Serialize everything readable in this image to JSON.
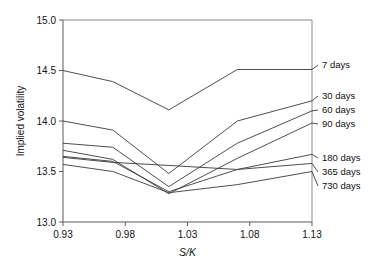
{
  "chart_data": {
    "type": "line",
    "title": "",
    "xlabel": "S/K",
    "ylabel": "Implied volatility",
    "xlim": [
      0.93,
      1.13
    ],
    "ylim": [
      13.0,
      15.0
    ],
    "xticks": [
      "0.93",
      "0.98",
      "1.03",
      "1.08",
      "1.13"
    ],
    "xtick_values": [
      0.93,
      0.98,
      1.03,
      1.08,
      1.13
    ],
    "yticks": [
      "13.0",
      "13.5",
      "14.0",
      "14.5",
      "15.0"
    ],
    "ytick_values": [
      13.0,
      13.5,
      14.0,
      14.5,
      15.0
    ],
    "grid": false,
    "legend_position": "right-outside",
    "x": [
      0.93,
      0.97,
      1.015,
      1.07,
      1.13
    ],
    "series": [
      {
        "name": "7 days",
        "values": [
          14.5,
          14.39,
          14.11,
          14.51,
          14.51
        ]
      },
      {
        "name": "30 days",
        "values": [
          14.0,
          13.91,
          13.48,
          14.0,
          14.2
        ]
      },
      {
        "name": "60 days",
        "values": [
          13.78,
          13.74,
          13.35,
          13.78,
          14.1
        ]
      },
      {
        "name": "90 days",
        "values": [
          13.71,
          13.62,
          13.28,
          13.63,
          13.98
        ]
      },
      {
        "name": "180 days",
        "values": [
          13.65,
          13.6,
          13.3,
          13.52,
          13.67
        ]
      },
      {
        "name": "365 days",
        "values": [
          13.64,
          13.59,
          13.56,
          13.52,
          13.58
        ]
      },
      {
        "name": "730 days",
        "values": [
          13.57,
          13.5,
          13.29,
          13.37,
          13.5
        ]
      }
    ],
    "legend_entries": [
      {
        "label": "7 days",
        "anchor_y": 14.51
      },
      {
        "label": "30 days",
        "anchor_y": 14.2
      },
      {
        "label": "60 days",
        "anchor_y": 14.1
      },
      {
        "label": "90 days",
        "anchor_y": 13.98
      },
      {
        "label": "180 days",
        "anchor_y": 13.67
      },
      {
        "label": "365 days",
        "anchor_y": 13.58
      },
      {
        "label": "730 days",
        "anchor_y": 13.5
      }
    ]
  }
}
